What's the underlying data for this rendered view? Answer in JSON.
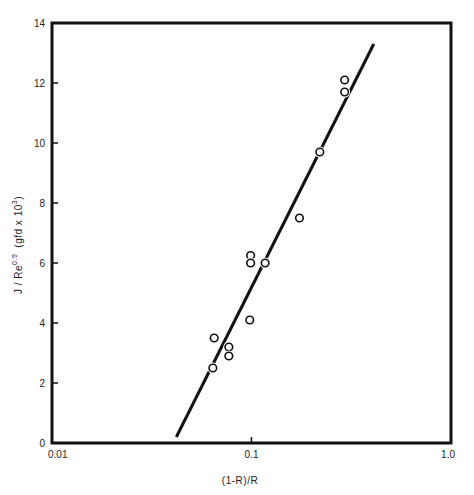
{
  "chart_data": {
    "type": "scatter",
    "title": "",
    "xlabel": "(1-R)/R",
    "ylabel": "J/Re^0.9 (gfd x 10^3)",
    "ylabel_parts": {
      "main": "J / Re",
      "exp": "0.9",
      "unit": "(gfd x 10",
      "unit_exp": "3",
      "unit_close": ")"
    },
    "xscale": "log",
    "xlim": [
      0.01,
      1.0
    ],
    "ylim": [
      0,
      14
    ],
    "xticks": [
      0.01,
      0.1,
      1.0
    ],
    "xtick_labels": [
      "0.01",
      "0.1",
      "1.0"
    ],
    "yticks": [
      0,
      2,
      4,
      6,
      8,
      10,
      12,
      14
    ],
    "ytick_labels": [
      "0",
      "2",
      "4",
      "6",
      "8",
      "10",
      "12",
      "14"
    ],
    "grid": false,
    "legend": null,
    "series": [
      {
        "name": "data",
        "marker": "open-circle",
        "points": [
          {
            "x": 0.064,
            "y": 2.5
          },
          {
            "x": 0.065,
            "y": 3.5
          },
          {
            "x": 0.077,
            "y": 3.2
          },
          {
            "x": 0.077,
            "y": 2.9
          },
          {
            "x": 0.098,
            "y": 4.1
          },
          {
            "x": 0.099,
            "y": 6.25
          },
          {
            "x": 0.099,
            "y": 6.0
          },
          {
            "x": 0.117,
            "y": 6.0
          },
          {
            "x": 0.174,
            "y": 7.5
          },
          {
            "x": 0.22,
            "y": 9.7
          },
          {
            "x": 0.293,
            "y": 12.1
          },
          {
            "x": 0.293,
            "y": 11.7
          }
        ]
      },
      {
        "name": "fit",
        "type": "line",
        "points": [
          {
            "x": 0.042,
            "y": 0.2
          },
          {
            "x": 0.41,
            "y": 13.3
          }
        ]
      }
    ]
  },
  "style": {
    "ink": "#111111",
    "background": "#ffffff"
  }
}
